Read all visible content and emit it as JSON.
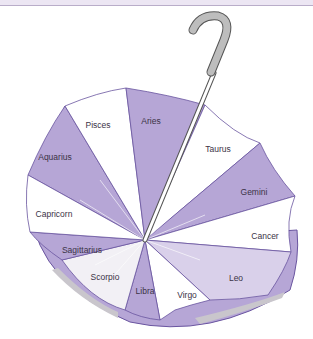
{
  "diagram": {
    "colors": {
      "panel_purple": "#b6a6d6",
      "panel_light": "#d9d0ea",
      "panel_white": "#ffffff",
      "outline": "#6a55a0",
      "handle_fill": "#bdbdbd",
      "handle_stroke": "#555555",
      "rim_grey": "#c9c6cc"
    },
    "panels": [
      {
        "label": "Pisces"
      },
      {
        "label": "Aries"
      },
      {
        "label": "Taurus"
      },
      {
        "label": "Gemini"
      },
      {
        "label": "Cancer"
      },
      {
        "label": "Leo"
      },
      {
        "label": "Virgo"
      },
      {
        "label": "Libra"
      },
      {
        "label": "Scorpio"
      },
      {
        "label": "Sagittarius"
      },
      {
        "label": "Capricorn"
      },
      {
        "label": "Aquarius"
      }
    ]
  }
}
